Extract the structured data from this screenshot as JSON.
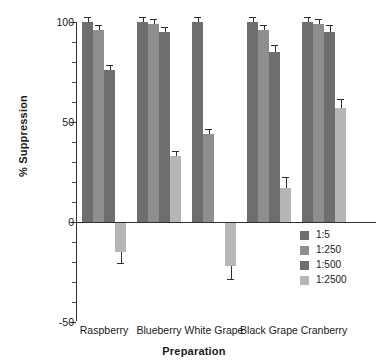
{
  "chart_data": {
    "type": "bar",
    "title": "",
    "xlabel": "Preparation",
    "ylabel": "% Suppression",
    "categories": [
      "Raspberry",
      "Blueberry",
      "White Grape",
      "Black Grape",
      "Cranberry"
    ],
    "series": [
      {
        "name": "1:5",
        "color": "#6e6e6e",
        "values": [
          100,
          100,
          100,
          100,
          100
        ],
        "errors": [
          1,
          1,
          1,
          1,
          1
        ]
      },
      {
        "name": "1:250",
        "color": "#8e8e8e",
        "values": [
          96,
          99,
          44,
          96,
          99
        ],
        "errors": [
          1,
          1,
          1,
          1,
          1
        ]
      },
      {
        "name": "1:500",
        "color": "#6e6e6e",
        "values": [
          76,
          95,
          0,
          85,
          95
        ],
        "errors": [
          1,
          1,
          0,
          2,
          2
        ]
      },
      {
        "name": "1:2500",
        "color": "#b6b6b6",
        "values": [
          -15,
          33,
          -22,
          17,
          57
        ],
        "errors": [
          4,
          1,
          5,
          4,
          3
        ]
      }
    ],
    "ylim": [
      -50,
      100
    ],
    "yticks": [
      -50,
      0,
      50,
      100
    ],
    "ytick_labels": [
      "-50",
      "0",
      "50",
      "100"
    ],
    "yminor_step": 10,
    "grid": false,
    "legend_position": "lower-right",
    "axis_color": "#303030"
  },
  "legend": {
    "items": [
      "1:5",
      "1:250",
      "1:500",
      "1:2500"
    ]
  }
}
